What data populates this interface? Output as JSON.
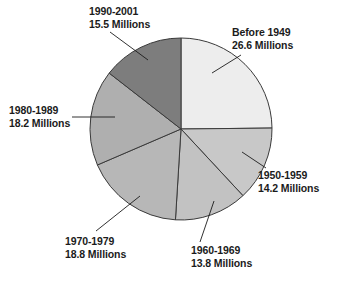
{
  "chart_data": {
    "type": "pie",
    "title": "",
    "unit": "Millions",
    "total": 107.1,
    "center": {
      "x": 181,
      "y": 129
    },
    "radius": 91,
    "start_angle_deg": 0,
    "direction": "clockwise",
    "legend": "none",
    "grid": false,
    "categories": [
      "Before 1949",
      "1950-1959",
      "1960-1969",
      "1970-1979",
      "1980-1989",
      "1990-2001"
    ],
    "values": [
      26.6,
      14.2,
      13.8,
      18.8,
      18.2,
      15.5
    ],
    "slices": [
      {
        "id": "before-1949",
        "label": "Before 1949",
        "value_text": "26.6 Millions",
        "value": 26.6,
        "color": "#ededed",
        "start_deg": 0,
        "end_deg": 89.4,
        "leader": {
          "x1": 241,
          "y1": 55,
          "x2": 212,
          "y2": 73
        }
      },
      {
        "id": "1950-1959",
        "label": "1950-1959",
        "value_text": "14.2 Millions",
        "value": 14.2,
        "color": "#c8c8c8",
        "start_deg": 89.4,
        "end_deg": 137.1,
        "leader": {
          "x1": 266,
          "y1": 168,
          "x2": 242,
          "y2": 152
        }
      },
      {
        "id": "1960-1969",
        "label": "1960-1969",
        "value_text": "13.8 Millions",
        "value": 13.8,
        "color": "#c2c2c2",
        "start_deg": 137.1,
        "end_deg": 183.5,
        "leader": {
          "x1": 200,
          "y1": 242,
          "x2": 214,
          "y2": 201
        }
      },
      {
        "id": "1970-1979",
        "label": "1970-1979",
        "value_text": "18.8 Millions",
        "value": 18.8,
        "color": "#b7b7b7",
        "start_deg": 183.5,
        "end_deg": 246.7,
        "leader": {
          "x1": 96,
          "y1": 231,
          "x2": 140,
          "y2": 196
        }
      },
      {
        "id": "1980-1989",
        "label": "1980-1989",
        "value_text": "18.2 Millions",
        "value": 18.2,
        "color": "#afafaf",
        "start_deg": 246.7,
        "end_deg": 307.9,
        "leader": {
          "x1": 72,
          "y1": 117,
          "x2": 115,
          "y2": 117
        }
      },
      {
        "id": "1990-2001",
        "label": "1990-2001",
        "value_text": "15.5 Millions",
        "value": 15.5,
        "color": "#7d7d7d",
        "start_deg": 307.9,
        "end_deg": 360,
        "leader": {
          "x1": 110,
          "y1": 32,
          "x2": 148,
          "y2": 60
        }
      }
    ],
    "stroke_color": "#3a3a3a",
    "background": "#ffffff"
  }
}
